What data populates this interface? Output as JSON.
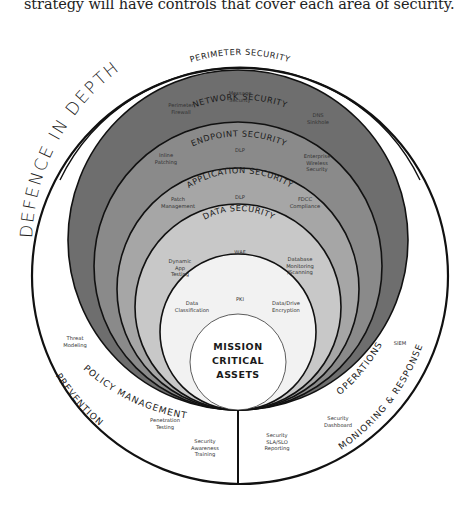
{
  "caption": "strategy will have controls that cover each area of security.",
  "diagram": {
    "title": "DEFENCE IN DEPTH",
    "layers": [
      {
        "name": "PERIMETER SECURITY",
        "color": "#6e6e6e",
        "controls": [
          "Perimeter Firewall",
          "Message Security",
          "DNS Sinkhole"
        ]
      },
      {
        "name": "NETWORK SECURITY",
        "color": "#8a8a8a",
        "controls": [
          "Inline Patching",
          "DLP",
          "Enterprise Wireless Security"
        ]
      },
      {
        "name": "ENDPOINT SECURITY",
        "color": "#a6a6a6",
        "controls": [
          "Patch Management",
          "DLP",
          "FDCC Compliance"
        ]
      },
      {
        "name": "APPLICATION SECURITY",
        "color": "#c8c8c8",
        "controls": [
          "Dynamic App Testing",
          "WAF",
          "Database Monitoring /Scanning"
        ]
      },
      {
        "name": "DATA SECURITY",
        "color": "#f2f2f2",
        "controls": [
          "Data Classification",
          "PKI",
          "Data/Drive Encryption"
        ]
      }
    ],
    "core": [
      "MISSION",
      "CRITICAL",
      "ASSETS"
    ],
    "left": {
      "inner_label": "POLICY MANAGEMENT",
      "outer_label": "PREVENTION",
      "controls": [
        "Threat Modeling",
        "Penetration Testing",
        "Security Awareness Training"
      ]
    },
    "right": {
      "inner_label": "OPERATIONS",
      "outer_label": "MONIORING & RESPONSE",
      "controls": [
        "SIEM",
        "Security Dashboard",
        "Security SLA/SLO Reporting"
      ]
    }
  }
}
